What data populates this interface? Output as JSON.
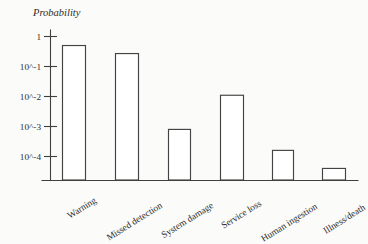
{
  "chart_data": {
    "type": "bar",
    "title": "",
    "xlabel": "",
    "ylabel": "Probability",
    "yscale": "log",
    "ylim": [
      2e-05,
      1
    ],
    "grid": false,
    "legend": null,
    "ytick_labels": [
      "1",
      "10^-1",
      "10^-2",
      "10^-3",
      "10^-4"
    ],
    "ytick_values": [
      1,
      0.1,
      0.01,
      0.001,
      0.0001
    ],
    "categories": [
      "Warning",
      "Missed detection",
      "System damage",
      "Service loss",
      "Human ingestion",
      "Illness/death"
    ],
    "values": [
      0.5,
      0.27,
      0.0008,
      0.011,
      0.00016,
      4e-05
    ],
    "bars": [
      {
        "label": "Warning",
        "value": 0.5
      },
      {
        "label": "Missed detection",
        "value": 0.27
      },
      {
        "label": "System damage",
        "value": 0.0008
      },
      {
        "label": "Service loss",
        "value": 0.011
      },
      {
        "label": "Human ingestion",
        "value": 0.00016
      },
      {
        "label": "Illness/death",
        "value": 4e-05
      }
    ],
    "colors": {
      "bar_fill": "#ffffff",
      "bar_stroke": "#434343",
      "axis": "#3f3f3f",
      "text": "#2e2e2e",
      "background": "#fbfbf9"
    }
  }
}
